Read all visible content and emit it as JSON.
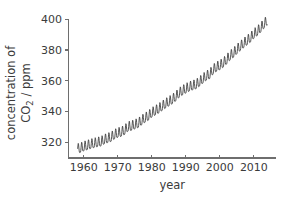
{
  "chart_data": {
    "type": "line",
    "title": "",
    "subtitle": "",
    "xlabel": "year",
    "ylabel_line1": "concentration of",
    "ylabel_line2_pre": "CO",
    "ylabel_line2_sub": "2",
    "ylabel_line2_post": " / ppm",
    "ylabel_plain": "concentration of CO2 / ppm",
    "xlim": [
      1955.5,
      2016.5
    ],
    "ylim": [
      310.0,
      402.0
    ],
    "xticks": [
      1960,
      1970,
      1980,
      1990,
      2000,
      2010
    ],
    "xtick_labels": [
      "1960",
      "1970",
      "1980",
      "1990",
      "2000",
      "2010"
    ],
    "yticks": [
      320,
      340,
      360,
      380,
      400
    ],
    "ytick_labels": [
      "320",
      "340",
      "360",
      "380",
      "400"
    ],
    "grid": false,
    "legend": false,
    "legend_position": "none",
    "line_color": "#3a3a3a",
    "axis_color": "#6e6e6e",
    "background_color": "#ffffff",
    "seasonal_amplitude_ppm": 3.1,
    "series": [
      {
        "name": "Mauna Loa monthly mean CO2",
        "x_start": 1958.2,
        "x_end": 2014.0,
        "annual_trend_x": [
          1958,
          1959,
          1960,
          1961,
          1962,
          1963,
          1964,
          1965,
          1966,
          1967,
          1968,
          1969,
          1970,
          1971,
          1972,
          1973,
          1974,
          1975,
          1976,
          1977,
          1978,
          1979,
          1980,
          1981,
          1982,
          1983,
          1984,
          1985,
          1986,
          1987,
          1988,
          1989,
          1990,
          1991,
          1992,
          1993,
          1994,
          1995,
          1996,
          1997,
          1998,
          1999,
          2000,
          2001,
          2002,
          2003,
          2004,
          2005,
          2006,
          2007,
          2008,
          2009,
          2010,
          2011,
          2012,
          2013,
          2014
        ],
        "annual_trend_y": [
          315.3,
          315.9,
          316.9,
          317.6,
          318.4,
          319.0,
          319.6,
          320.0,
          321.4,
          322.2,
          323.0,
          324.6,
          325.7,
          326.3,
          327.5,
          329.7,
          330.2,
          331.1,
          332.0,
          333.8,
          335.4,
          336.8,
          338.8,
          340.1,
          341.4,
          343.0,
          344.6,
          346.0,
          347.4,
          349.2,
          351.6,
          353.1,
          354.4,
          355.6,
          356.4,
          357.1,
          358.8,
          360.8,
          362.6,
          363.7,
          366.7,
          368.4,
          369.5,
          371.1,
          373.2,
          375.8,
          377.5,
          379.8,
          381.9,
          383.8,
          385.6,
          387.4,
          389.9,
          391.6,
          393.8,
          396.5,
          398.6
        ]
      }
    ]
  }
}
